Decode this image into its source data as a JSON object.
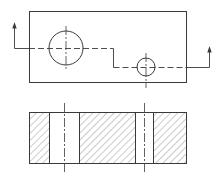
{
  "diagram": {
    "type": "engineering-drawing",
    "views": [
      {
        "name": "top-view",
        "rect": {
          "x": 29,
          "y": 11,
          "w": 157,
          "h": 71
        },
        "holes": [
          {
            "cx": 66,
            "cy": 48,
            "r": 17,
            "label": "large-hole"
          },
          {
            "cx": 146,
            "cy": 67,
            "r": 9,
            "label": "small-hole"
          }
        ],
        "section_line": {
          "points": [
            [
              14,
              48
            ],
            [
              113,
              48
            ],
            [
              113,
              67
            ],
            [
              209,
              67
            ]
          ],
          "arrows": [
            {
              "x": 14,
              "from_y": 48,
              "to_y": 23,
              "direction": "up"
            },
            {
              "x": 209,
              "from_y": 67,
              "to_y": 47,
              "direction": "up"
            }
          ]
        }
      },
      {
        "name": "section-view",
        "rect": {
          "x": 29,
          "y": 112,
          "w": 157,
          "h": 51
        },
        "hatched_blocks": [
          {
            "x": 29,
            "w": 20
          },
          {
            "x": 79,
            "w": 56
          },
          {
            "x": 153,
            "w": 33
          }
        ],
        "centerlines_x": [
          64,
          144
        ]
      }
    ],
    "colors": {
      "line": "#3a3a3a",
      "background": "#ffffff"
    }
  }
}
